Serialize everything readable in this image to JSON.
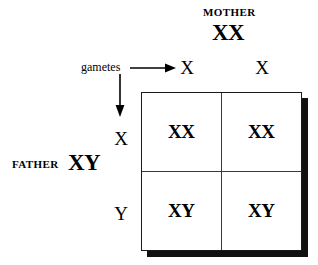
{
  "diagram": {
    "background_color": "#ffffff",
    "ink_color": "#000000"
  },
  "mother": {
    "label": "MOTHER",
    "genotype": "XX",
    "gametes": [
      "X",
      "X"
    ]
  },
  "father": {
    "label": "FATHER",
    "genotype": "XY",
    "gametes": [
      "X",
      "Y"
    ]
  },
  "annotation": {
    "gametes_label": "gametes",
    "arrow_right_icon": "arrow-right-icon",
    "arrow_down_icon": "arrow-down-icon"
  },
  "punnett": {
    "columns": [
      "X",
      "X"
    ],
    "rows": [
      "X",
      "Y"
    ],
    "cells": [
      [
        "XX",
        "XX"
      ],
      [
        "XY",
        "XY"
      ]
    ],
    "cell_00": "XX",
    "cell_01": "XX",
    "cell_10": "XY",
    "cell_11": "XY"
  }
}
